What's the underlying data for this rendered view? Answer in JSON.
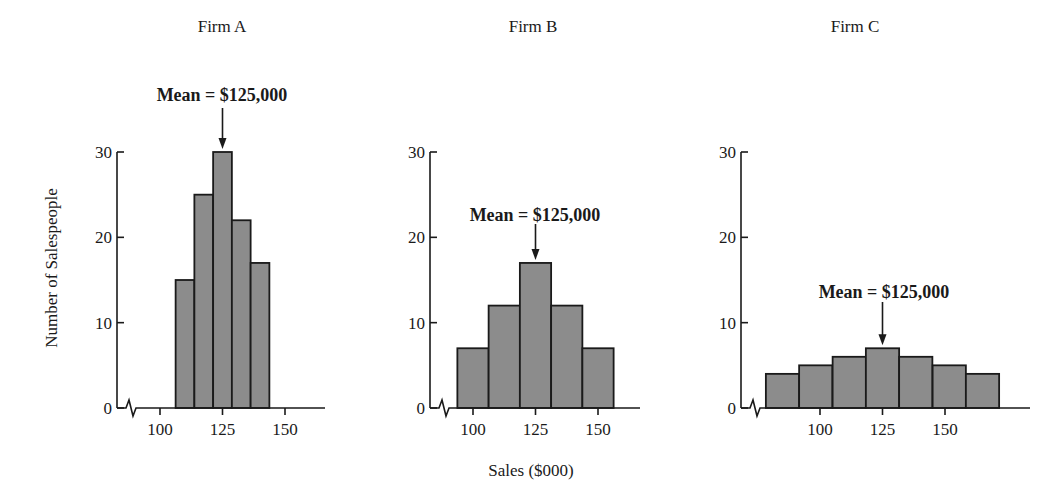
{
  "figure": {
    "xlabel": "Sales ($000)",
    "ylabel": "Number of Salespeople",
    "bar_fill": "#8c8c8c",
    "bar_stroke": "#1a1a1a"
  },
  "chart_data": [
    {
      "type": "bar",
      "title": "Firm A",
      "xlabel": "Sales ($000)",
      "ylabel": "Number of Salespeople",
      "ylim": [
        0,
        30
      ],
      "yticks": [
        0,
        10,
        20,
        30
      ],
      "xticks": [
        100,
        125,
        150
      ],
      "axis_break": true,
      "grid": false,
      "bin_width": 7.5,
      "bin_centers": [
        110,
        117.5,
        125,
        132.5,
        140
      ],
      "values": [
        15,
        25,
        30,
        22,
        17
      ],
      "annotation": {
        "text": "Mean = $125,000",
        "x": 125
      }
    },
    {
      "type": "bar",
      "title": "Firm B",
      "xlabel": "Sales ($000)",
      "ylabel": "",
      "ylim": [
        0,
        30
      ],
      "yticks": [
        0,
        10,
        20,
        30
      ],
      "xticks": [
        100,
        125,
        150
      ],
      "axis_break": true,
      "grid": false,
      "bin_width": 12.5,
      "bin_centers": [
        100,
        112.5,
        125,
        137.5,
        150
      ],
      "values": [
        7,
        12,
        17,
        12,
        7
      ],
      "annotation": {
        "text": "Mean = $125,000",
        "x": 125
      }
    },
    {
      "type": "bar",
      "title": "Firm C",
      "xlabel": "Sales ($000)",
      "ylabel": "",
      "ylim": [
        0,
        30
      ],
      "yticks": [
        0,
        10,
        20,
        30
      ],
      "xticks": [
        100,
        125,
        150
      ],
      "axis_break": true,
      "grid": false,
      "bin_width": 13.3,
      "bin_centers": [
        85,
        98.3,
        111.7,
        125,
        138.3,
        151.7,
        165
      ],
      "values": [
        4,
        5,
        6,
        7,
        6,
        5,
        4
      ],
      "annotation": {
        "text": "Mean = $125,000",
        "x": 125
      }
    }
  ],
  "layout": {
    "y0_px": 408,
    "y30_px": 152,
    "panels": [
      {
        "title_x": 222,
        "axis_x": 117,
        "axis_end_x": 325,
        "x100_px": 160,
        "x150_px": 285,
        "label_y": 95,
        "arrow_top": 108,
        "text_center_x": 222
      },
      {
        "title_x": 533,
        "axis_x": 430,
        "axis_end_x": 640,
        "x100_px": 473,
        "x150_px": 598,
        "label_y": 215,
        "arrow_top": 224,
        "text_center_x": 535
      },
      {
        "title_x": 855,
        "axis_x": 741,
        "axis_end_x": 1030,
        "x100_px": 820,
        "x150_px": 945,
        "label_y": 292,
        "arrow_top": 302,
        "text_center_x": 884
      }
    ]
  }
}
